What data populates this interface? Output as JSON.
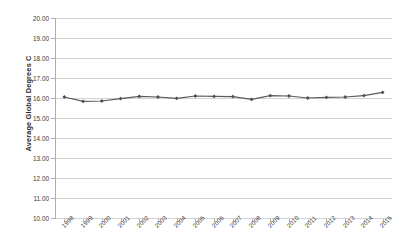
{
  "chart_data": {
    "type": "line",
    "title": "",
    "subtitle": "",
    "xlabel": "",
    "ylabel": "Average Global Degrees C",
    "ylim": [
      10.0,
      20.0
    ],
    "y_tick_step": 1.0,
    "grid": "horizontal",
    "legend": "none",
    "marker": "diamond",
    "line_color": "#5a5a5a",
    "marker_color": "#4d4d4d",
    "gridline_color": "#d2d2d2",
    "categories": [
      "1998",
      "1999",
      "2000",
      "2001",
      "2002",
      "2003",
      "2004",
      "2005",
      "2006",
      "2007",
      "2008",
      "2009",
      "2010",
      "2011",
      "2012",
      "2013",
      "2014",
      "2015"
    ],
    "values": [
      16.05,
      15.83,
      15.85,
      15.97,
      16.08,
      16.05,
      15.98,
      16.1,
      16.08,
      16.07,
      15.93,
      16.12,
      16.1,
      16.0,
      16.03,
      16.05,
      16.12,
      16.28
    ],
    "y_tick_labels": [
      "20.00",
      "19.00",
      "18.00",
      "17.00",
      "16.00",
      "15.00",
      "14.00",
      "13.00",
      "12.00",
      "11.00",
      "10.00"
    ],
    "y_tick_values": [
      20,
      19,
      18,
      17,
      16,
      15,
      14,
      13,
      12,
      11,
      10
    ]
  }
}
